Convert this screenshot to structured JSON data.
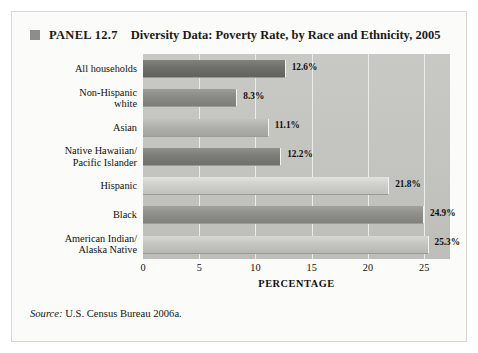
{
  "panel": {
    "bullet": "square-bullet-icon",
    "number": "PANEL 12.7",
    "title": "Diversity Data: Poverty Rate, by Race and Ethnicity, 2005"
  },
  "source": {
    "label": "Source:",
    "text": " U.S. Census Bureau 2006a."
  },
  "colors": {
    "plot_background": "#c5c5c1",
    "gridline": "#ececeb",
    "bullet": "#8d8d8d",
    "text": "#111111"
  },
  "chart_data": {
    "type": "bar",
    "orientation": "horizontal",
    "title": "Diversity Data: Poverty Rate, by Race and Ethnicity, 2005",
    "xlabel": "PERCENTAGE",
    "ylabel": "",
    "xlim": [
      0,
      27.3
    ],
    "xticks": [
      0,
      5,
      10,
      15,
      20,
      25
    ],
    "xtick_labels": [
      "0",
      "5",
      "10",
      "15",
      "20",
      "25"
    ],
    "grid": true,
    "legend": "none",
    "categories": [
      "All households",
      "Non-Hispanic white",
      "Asian",
      "Native Hawaiian/ Pacific Islander",
      "Hispanic",
      "Black",
      "American Indian/ Alaska Native"
    ],
    "category_lines": [
      [
        "All households"
      ],
      [
        "Non-Hispanic",
        "white"
      ],
      [
        "Asian"
      ],
      [
        "Native Hawaiian/",
        "Pacific Islander"
      ],
      [
        "Hispanic"
      ],
      [
        "Black"
      ],
      [
        "American Indian/",
        "Alaska Native"
      ]
    ],
    "values": [
      12.6,
      8.3,
      11.1,
      12.2,
      21.8,
      24.9,
      25.3
    ],
    "value_labels": [
      "12.6%",
      "8.3%",
      "11.1%",
      "12.2%",
      "21.8%",
      "24.9%",
      "25.3%"
    ],
    "bar_colors": [
      "#6f6f6c",
      "#8a8a86",
      "#b0b0ac",
      "#7d7d79",
      "#cfcfcb",
      "#8f8f8b",
      "#c5c5c1"
    ]
  }
}
